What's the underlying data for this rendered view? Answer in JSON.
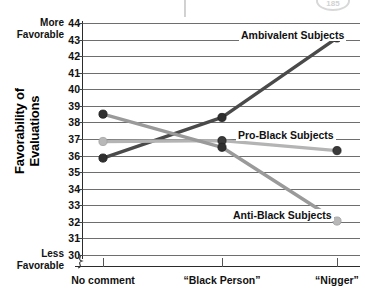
{
  "chart_data": {
    "type": "line",
    "title": "",
    "xlabel": "",
    "ylabel": "Favorability of\nEvaluations",
    "categories": [
      "No comment",
      "“Black Person”",
      "“Nigger”"
    ],
    "ylim": [
      30,
      44
    ],
    "ytick_labels": [
      "44",
      "43",
      "42",
      "41",
      "40",
      "39",
      "38",
      "37",
      "36",
      "35",
      "34",
      "33",
      "32",
      "31",
      "30"
    ],
    "ytick_values": [
      44,
      43,
      42,
      41,
      40,
      39,
      38,
      37,
      36,
      35,
      34,
      33,
      32,
      31,
      30
    ],
    "grid": true,
    "axis_break_below_min": true,
    "legend_position": "inline-labels",
    "axis_notes": {
      "top": "More\nFavorable",
      "bottom": "Less\nFavorable"
    },
    "series": [
      {
        "name": "Ambivalent Subjects",
        "values": [
          35.85,
          38.3,
          43.1
        ],
        "line_color": "#4a4a4a",
        "marker_color": "#2f2f2f",
        "label": "Ambivalent Subjects"
      },
      {
        "name": "Pro-Black Subjects",
        "values": [
          36.85,
          36.9,
          36.3
        ],
        "line_color": "#b4b4b4",
        "marker_color": "#3a3a3a",
        "label": "Pro-Black Subjects"
      },
      {
        "name": "Anti-Black Subjects",
        "values": [
          38.5,
          36.5,
          32.05
        ],
        "line_color": "#9a9a9a",
        "marker_color": "#2f2f2f",
        "label": "Anti-Black Subjects"
      }
    ],
    "colors": {
      "axis": "#2b2b2b",
      "grid": "#6e6e6e",
      "text": "#111111",
      "background": "#ffffff"
    }
  },
  "artifacts": {
    "page_badge_text": "185"
  }
}
